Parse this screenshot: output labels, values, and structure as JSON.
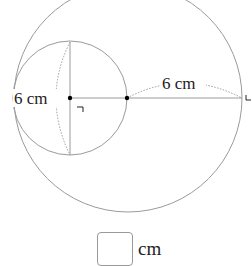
{
  "diagram": {
    "big_circle": {
      "cx": 128,
      "cy": 98,
      "r": 114
    },
    "small_circle": {
      "cx": 70,
      "cy": 98,
      "r": 57
    },
    "labels": {
      "small_radius": "6 cm",
      "big_segment": "6 cm",
      "right_angle_mark": "┐"
    },
    "stroke_color": "#9a9a9a",
    "dot_color": "#000000"
  },
  "answer": {
    "value": "",
    "unit": "cm"
  }
}
